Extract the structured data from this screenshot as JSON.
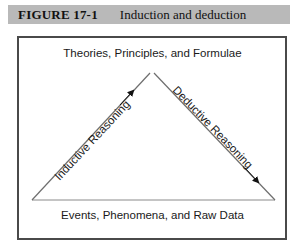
{
  "figure": {
    "number": "FIGURE 17-1",
    "caption": "Induction and deduction",
    "header_bg": "#b9b9b9",
    "frame_color": "#4a4a4a"
  },
  "diagram": {
    "type": "triangle-cycle",
    "apex_label": "Theories, Principles, and Formulae",
    "base_label": "Events, Phenomena, and Raw Data",
    "left_edge_label": "Inductive Reasoning",
    "right_edge_label": "Deductive Reasoning",
    "left_arrow_direction": "up-right",
    "right_arrow_direction": "down-right",
    "line_color": "#6e6e6e",
    "text_color": "#1a1a1a"
  }
}
